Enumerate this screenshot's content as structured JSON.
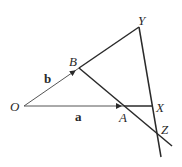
{
  "diagram": {
    "type": "vector-geometry",
    "points": {
      "O": {
        "label": "O",
        "x": 24,
        "y": 106
      },
      "B": {
        "label": "B",
        "x": 79,
        "y": 68
      },
      "A": {
        "label": "A",
        "x": 124,
        "y": 106
      },
      "Y": {
        "label": "Y",
        "x": 139,
        "y": 27
      },
      "X": {
        "label": "X",
        "x": 152,
        "y": 106
      },
      "Z": {
        "label": "Z",
        "x": 157,
        "y": 133
      }
    },
    "vectors": {
      "a": {
        "label": "a",
        "from": "O",
        "to": "A"
      },
      "b": {
        "label": "b",
        "from": "O",
        "to": "B"
      }
    },
    "segments": [
      {
        "from": "B",
        "to": "Y"
      },
      {
        "from": "A",
        "to": "X"
      },
      {
        "from": "B",
        "to": "extendBA"
      },
      {
        "from": "Y",
        "to": "extendYZ"
      }
    ],
    "colors": {
      "stroke": "#2a2a2a",
      "thin": "#555555"
    }
  }
}
